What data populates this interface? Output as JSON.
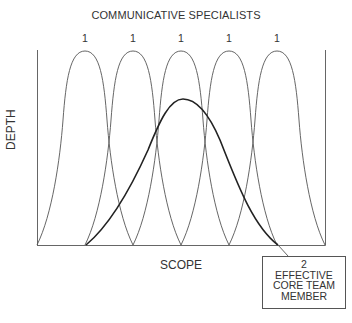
{
  "diagram": {
    "title": "COMMUNICATIVE SPECIALISTS",
    "specialist_labels": [
      "1",
      "1",
      "1",
      "1",
      "1"
    ],
    "y_axis_label": "DEPTH",
    "x_axis_label": "SCOPE",
    "callout": {
      "number": "2",
      "lines": [
        "EFFECTIVE",
        "CORE TEAM",
        "MEMBER"
      ]
    },
    "curves": {
      "specialists": {
        "count": 5,
        "shape": "narrow tall bell",
        "stroke": "#555555"
      },
      "core_team_member": {
        "count": 1,
        "shape": "wide lower bell",
        "stroke": "#222222"
      }
    }
  }
}
